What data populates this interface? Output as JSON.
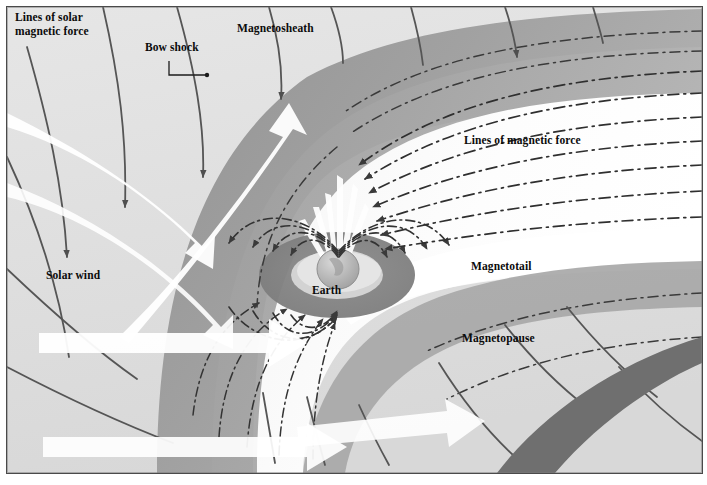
{
  "figure": {
    "frame": {
      "border_color": "#4a4a4a",
      "background": "#e3e3e3"
    }
  },
  "palette": {
    "background_light": "#e3e3e3",
    "sheath_gray": "#9a9a9a",
    "sheath_dark": "#8a8a8a",
    "magnetopause_band": "#a6a6a6",
    "tail_white": "#fdfdfd",
    "lobe_light": "#efefef",
    "belt_dark": "#8e8e8e",
    "belt_darker": "#7d7d7d",
    "earth_body": "#b9b9b9",
    "field_line": "#3a3a3a",
    "solar_line": "#5a5a5a",
    "solar_wind_arrow": "#ffffff",
    "bow_shock_band": "#6f6f6f",
    "text": "#0b0b0b"
  },
  "labels": [
    {
      "id": "lines-of-solar-magnetic-force",
      "text": "Lines of solar\nmagnetic force",
      "x": 14,
      "y": 10
    },
    {
      "id": "bow-shock",
      "text": "Bow shock",
      "x": 144,
      "y": 40
    },
    {
      "id": "magnetosheath",
      "text": "Magnetosheath",
      "x": 236,
      "y": 21
    },
    {
      "id": "lines-of-magnetic-force",
      "text": "Lines of magnetic force",
      "x": 463,
      "y": 133
    },
    {
      "id": "solar-wind",
      "text": "Solar wind",
      "x": 45,
      "y": 268
    },
    {
      "id": "magnetotail",
      "text": "Magnetotail",
      "x": 470,
      "y": 259
    },
    {
      "id": "magnetopause",
      "text": "Magnetopause",
      "x": 461,
      "y": 331
    },
    {
      "id": "earth",
      "text": "Earth",
      "x": 311,
      "y": 283
    }
  ],
  "leader_lines": [
    {
      "id": "bow-shock-leader",
      "from": [
        168,
        60
      ],
      "to": [
        168,
        74
      ],
      "then": [
        205,
        74
      ],
      "dot": [
        205,
        74
      ]
    }
  ],
  "annotations": {
    "solar_wind_arrow_count": 4,
    "tail_field_line_count": 7,
    "solar_field_line_count": 6,
    "field_direction_note": "tail lines point sunward (left); closed lines converge on poles"
  }
}
